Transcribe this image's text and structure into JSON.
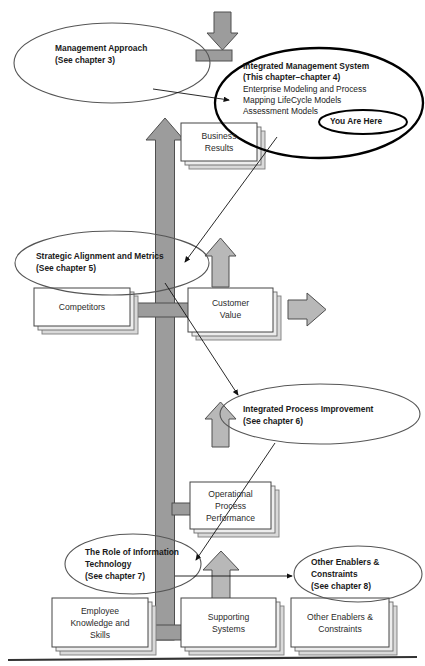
{
  "diagram": {
    "type": "tree-framework-diagram",
    "colors": {
      "arrow_fill": "#9c9c9c",
      "arrow_stroke": "#555555",
      "box_fill": "#ffffff",
      "box_stroke": "#4a4a4a",
      "box_shadow": "#c6c6c6",
      "ellipse_stroke": "#555555",
      "highlight_stroke": "#000000",
      "text": "#1a1a1a",
      "ground_line": "#333333"
    },
    "ellipses": [
      {
        "id": "management-approach",
        "lines": [
          "Management Approach",
          "(See chapter 3)"
        ],
        "bold": [
          true,
          true
        ],
        "emphasis": "normal"
      },
      {
        "id": "integrated-management-system",
        "lines": [
          "Integrated Management System",
          "(This chapter–chapter 4)",
          "Enterprise Modeling and Process",
          "Mapping LifeCycle Models",
          "Assessment Models"
        ],
        "bold": [
          true,
          true,
          false,
          false,
          false
        ],
        "emphasis": "heavy",
        "badge": "You Are Here"
      },
      {
        "id": "strategic-alignment-and-metrics",
        "lines": [
          "Strategic Alignment and Metrics",
          "(See chapter 5)"
        ],
        "bold": [
          true,
          true
        ],
        "emphasis": "normal"
      },
      {
        "id": "integrated-process-improvement",
        "lines": [
          "Integrated Process Improvement",
          "(See chapter 6)"
        ],
        "bold": [
          true,
          true
        ],
        "emphasis": "normal"
      },
      {
        "id": "role-of-information-technology",
        "lines": [
          "The Role of Information",
          "Technology",
          "(See chapter 7)"
        ],
        "bold": [
          true,
          true,
          true
        ],
        "emphasis": "normal"
      },
      {
        "id": "other-enablers-and-constraints",
        "lines": [
          "Other Enablers &",
          "Constraints",
          "(See chapter 8)"
        ],
        "bold": [
          true,
          true,
          true
        ],
        "emphasis": "normal"
      }
    ],
    "boxes": [
      {
        "id": "business-results",
        "lines": [
          "Business",
          "Results"
        ]
      },
      {
        "id": "competitors",
        "lines": [
          "Competitors"
        ]
      },
      {
        "id": "customer-value",
        "lines": [
          "Customer",
          "Value"
        ]
      },
      {
        "id": "operational-process-performance",
        "lines": [
          "Operational",
          "Process",
          "Performance"
        ]
      },
      {
        "id": "employee-knowledge-and-skills",
        "lines": [
          "Employee",
          "Knowledge and",
          "Skills"
        ]
      },
      {
        "id": "supporting-systems",
        "lines": [
          "Supporting",
          "Systems"
        ]
      },
      {
        "id": "other-enablers-and-constraints-box",
        "lines": [
          "Other Enablers &",
          "Constraints"
        ]
      }
    ],
    "badges": {
      "you_are_here": "You Are Here"
    },
    "labels": {
      "ellipse_1_line_1": "Management Approach",
      "ellipse_1_line_2": "(See chapter 3)",
      "ellipse_2_line_1": "Integrated Management System",
      "ellipse_2_line_2": "(This chapter–chapter 4)",
      "ellipse_2_line_3": "Enterprise Modeling and Process",
      "ellipse_2_line_4": "Mapping LifeCycle Models",
      "ellipse_2_line_5": "Assessment Models",
      "ellipse_3_line_1": "Strategic Alignment and Metrics",
      "ellipse_3_line_2": "(See chapter 5)",
      "ellipse_4_line_1": "Integrated Process Improvement",
      "ellipse_4_line_2": "(See chapter 6)",
      "ellipse_5_line_1": "The Role of Information",
      "ellipse_5_line_2": "Technology",
      "ellipse_5_line_3": "(See chapter 7)",
      "ellipse_6_line_1": "Other Enablers &",
      "ellipse_6_line_2": "Constraints",
      "ellipse_6_line_3": "(See chapter 8)",
      "box_1_line_1": "Business",
      "box_1_line_2": "Results",
      "box_2_line_1": "Competitors",
      "box_3_line_1": "Customer",
      "box_3_line_2": "Value",
      "box_4_line_1": "Operational",
      "box_4_line_2": "Process",
      "box_4_line_3": "Performance",
      "box_5_line_1": "Employee",
      "box_5_line_2": "Knowledge and",
      "box_5_line_3": "Skills",
      "box_6_line_1": "Supporting",
      "box_6_line_2": "Systems",
      "box_7_line_1": "Other Enablers &",
      "box_7_line_2": "Constraints"
    }
  }
}
